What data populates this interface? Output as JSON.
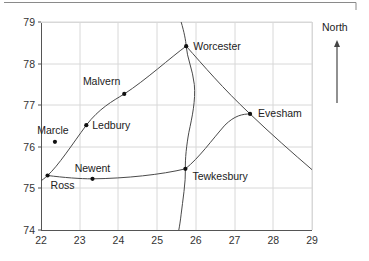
{
  "figure": {
    "title": "",
    "top_rule": {
      "name": "page-top-rule",
      "x1": 4,
      "y1": 2.5,
      "x2": 356,
      "y2": 2.5,
      "stub_y2": 10
    },
    "colors": {
      "axis": "#555555",
      "grid": "#d8d8d8",
      "curve": "#4a4a4a",
      "point": "#111111",
      "text": "#222222",
      "background": "#ffffff"
    },
    "plot_area": {
      "left": 41,
      "top": 22,
      "right": 312,
      "bottom": 230
    }
  },
  "compass": {
    "label": "North",
    "label_x": 322,
    "label_y": 31,
    "arrow_x": 337,
    "arrow_top": 40,
    "arrow_bottom": 103
  },
  "chart_data": {
    "type": "scatter",
    "title": "",
    "xlabel": "",
    "ylabel": "",
    "xlim": [
      22,
      29
    ],
    "ylim": [
      74,
      79
    ],
    "xticks": [
      22,
      23,
      24,
      25,
      26,
      27,
      28,
      29
    ],
    "yticks": [
      74,
      75,
      76,
      77,
      78,
      79
    ],
    "xtick_labels": [
      "22",
      "23",
      "24",
      "25",
      "26",
      "27",
      "28",
      "29"
    ],
    "ytick_labels": [
      "74",
      "75",
      "76",
      "77",
      "78",
      "79"
    ],
    "grid": true,
    "legend": null,
    "points": [
      {
        "name": "Worcester",
        "x": 25.75,
        "y": 78.42,
        "label": "Worcester",
        "label_dx": 7,
        "label_dy": 3.5,
        "anchor": "start"
      },
      {
        "name": "Malvern",
        "x": 24.15,
        "y": 77.27,
        "label": "Malvern",
        "label_dx": -4,
        "label_dy": -9,
        "anchor": "end"
      },
      {
        "name": "Ledbury",
        "x": 23.17,
        "y": 76.52,
        "label": "Ledbury",
        "label_dx": 6,
        "label_dy": 3.5,
        "anchor": "start"
      },
      {
        "name": "Marcle",
        "x": 22.36,
        "y": 76.12,
        "label": "Marcle",
        "label_dx": -2,
        "label_dy": -8,
        "anchor": "middle"
      },
      {
        "name": "Ross",
        "x": 22.17,
        "y": 75.31,
        "label": "Ross",
        "label_dx": 3,
        "label_dy": 13,
        "anchor": "start"
      },
      {
        "name": "Newent",
        "x": 23.33,
        "y": 75.23,
        "label": "Newent",
        "label_dx": 0,
        "label_dy": -7,
        "anchor": "middle"
      },
      {
        "name": "Tewkesbury",
        "x": 25.73,
        "y": 75.47,
        "label": "Tewkesbury",
        "label_dx": 7,
        "label_dy": 11,
        "anchor": "start"
      },
      {
        "name": "Evesham",
        "x": 27.4,
        "y": 76.79,
        "label": "Evesham",
        "label_dx": 8,
        "label_dy": 3.5,
        "anchor": "start"
      }
    ],
    "routes": [
      {
        "name": "m5-north-south",
        "description": "Motorway running north-south through Worcester and Tewkesbury",
        "path": "M 25.62 79.00 C 25.70 78.75, 25.74 78.55, 25.75 78.42 C 25.77 78.15, 25.92 77.85, 25.96 77.50 C 26.00 77.12, 25.90 76.70, 25.82 76.35 C 25.76 76.05, 25.72 75.70, 25.73 75.47 C 25.74 75.15, 25.66 74.70, 25.62 74.38 C 25.60 74.22, 25.58 74.10, 25.56 74.00"
      },
      {
        "name": "ross-malvern-worcester",
        "description": "Road from Ross through Ledbury and Malvern to Worcester",
        "path": "M 22.00 75.18 C 22.10 75.25, 22.14 75.28, 22.17 75.31 C 22.45 75.55, 22.80 76.05, 23.17 76.52 C 23.50 76.92, 23.85 77.10, 24.15 77.27 C 24.70 77.60, 25.35 78.15, 25.75 78.42"
      },
      {
        "name": "ross-newent-tewkesbury",
        "description": "Road from Ross through Newent to Tewkesbury",
        "path": "M 22.17 75.31 C 22.60 75.26, 23.00 75.23, 23.33 75.23 C 24.20 75.24, 25.10 75.33, 25.73 75.47"
      },
      {
        "name": "worcester-evesham",
        "description": "Road from Worcester south-east to Evesham and beyond",
        "path": "M 25.75 78.42 C 26.20 77.95, 26.70 77.40, 27.40 76.79 C 27.95 76.30, 28.50 75.85, 29.00 75.45"
      },
      {
        "name": "tewkesbury-evesham",
        "description": "Road from Tewkesbury north-east to Evesham",
        "path": "M 25.73 75.47 C 26.10 75.75, 26.40 76.15, 26.75 76.52 C 27.00 76.75, 27.20 76.79, 27.40 76.79"
      }
    ]
  }
}
